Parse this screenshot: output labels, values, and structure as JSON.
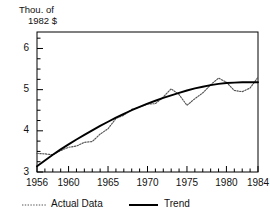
{
  "chart_data": {
    "type": "line",
    "title": "",
    "ylabel_lines": [
      "Thou. of",
      "1982 $"
    ],
    "xlabel": "",
    "xlim": [
      1956,
      1984
    ],
    "ylim": [
      3.0,
      6.4
    ],
    "xticks_major": [
      1956,
      1960,
      1965,
      1970,
      1975,
      1980,
      1984
    ],
    "xticks_major_labels": [
      "1956",
      "1960",
      "1965",
      "1970",
      "1975",
      "1980",
      "1984"
    ],
    "xticks_minor_step": 1,
    "yticks_major": [
      3,
      4,
      5,
      6
    ],
    "yticks_major_labels": [
      "3",
      "4",
      "5",
      "6"
    ],
    "yticks_minor_step": 0.25,
    "grid": false,
    "legend_position": "below-axes",
    "legend": [
      {
        "label": "Actual Data",
        "style": "dotted",
        "color": "#555555"
      },
      {
        "label": "Trend",
        "style": "solid",
        "color": "#000000"
      }
    ],
    "x": [
      1956,
      1957,
      1958,
      1959,
      1960,
      1961,
      1962,
      1963,
      1964,
      1965,
      1966,
      1967,
      1968,
      1969,
      1970,
      1971,
      1972,
      1973,
      1974,
      1975,
      1976,
      1977,
      1978,
      1979,
      1980,
      1981,
      1982,
      1983,
      1984
    ],
    "series": [
      {
        "name": "Actual Data",
        "style": "dotted",
        "color": "#555555",
        "values": [
          3.45,
          3.44,
          3.42,
          3.52,
          3.6,
          3.63,
          3.72,
          3.74,
          3.92,
          4.05,
          4.3,
          4.38,
          4.52,
          4.58,
          4.65,
          4.66,
          4.82,
          5.02,
          4.88,
          4.62,
          4.78,
          4.92,
          5.12,
          5.28,
          5.18,
          4.98,
          4.95,
          5.04,
          5.3
        ]
      },
      {
        "name": "Trend",
        "style": "solid",
        "color": "#000000",
        "values": [
          3.14,
          3.28,
          3.42,
          3.55,
          3.67,
          3.79,
          3.9,
          4.01,
          4.12,
          4.22,
          4.32,
          4.41,
          4.5,
          4.58,
          4.66,
          4.73,
          4.8,
          4.86,
          4.92,
          4.98,
          5.03,
          5.07,
          5.11,
          5.14,
          5.16,
          5.17,
          5.18,
          5.18,
          5.18
        ]
      }
    ]
  },
  "plot_geometry": {
    "left": 37,
    "right": 258,
    "top": 32,
    "bottom": 172
  },
  "frame": {
    "border_color": "#000000"
  }
}
